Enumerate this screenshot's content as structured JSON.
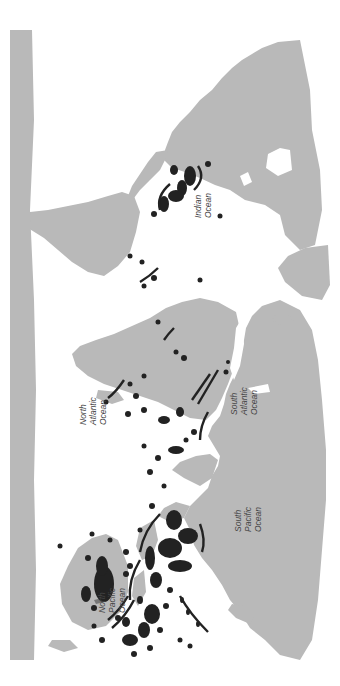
{
  "map": {
    "type": "world-map",
    "orientation": "rotated 90 degrees clockwise (north points left)",
    "colors": {
      "background": "#ffffff",
      "land": "#b9b9b9",
      "reef_markers": "#222222",
      "label_text": "#444444"
    },
    "ocean_labels": [
      {
        "id": "indian",
        "lines": [
          "Indian",
          "Ocean"
        ]
      },
      {
        "id": "north-atlantic",
        "lines": [
          "North",
          "Atlantic",
          "Ocean"
        ]
      },
      {
        "id": "south-atlantic",
        "lines": [
          "South",
          "Atlantic",
          "Ocean"
        ]
      },
      {
        "id": "south-pacific",
        "lines": [
          "South",
          "Pacific",
          "Ocean"
        ]
      },
      {
        "id": "north-pacific",
        "lines": [
          "North",
          "Pacific",
          "Ocean"
        ]
      }
    ],
    "marker_regions": [
      "Red Sea",
      "Persian Gulf / Arabian Sea",
      "East Africa & Madagascar",
      "Indian Ocean islands",
      "Southeast Asia / Indonesia",
      "Northern Australia / Great Barrier Reef",
      "Melanesia / Pacific islands",
      "Hawaiian chain",
      "Caribbean",
      "Brazil coast",
      "West Africa"
    ]
  }
}
